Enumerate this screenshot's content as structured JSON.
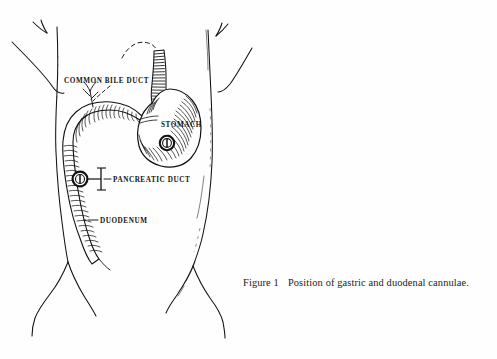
{
  "figure": {
    "caption_prefix": "Figure 1",
    "caption_text": "Position of gastric and duodenal cannulae.",
    "ink_color": "#111111",
    "background_color": "#fefefe"
  },
  "labels": {
    "common_bile_duct": "COMMON BILE DUCT",
    "stomach": "STOMACH",
    "pancreatic_duct": "PANCREATIC DUCT",
    "duodenum": "DUODENUM"
  },
  "diagram": {
    "organs": [
      "esophagus",
      "stomach",
      "duodenum",
      "common-bile-duct",
      "pancreatic-duct"
    ],
    "devices": [
      "gastric-cannula",
      "duodenal-cannula"
    ],
    "style": "pen-and-ink line engraving with hatching"
  }
}
